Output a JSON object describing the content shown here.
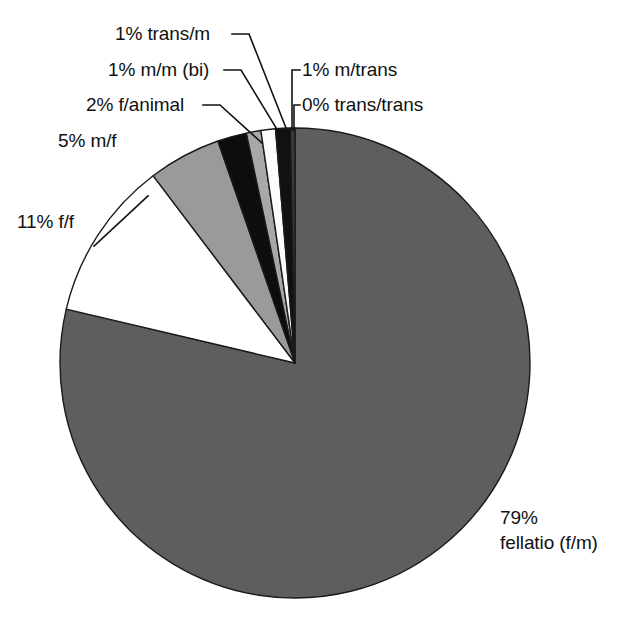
{
  "chart_data": {
    "type": "pie",
    "title": "",
    "subtitle": "",
    "xlabel": "",
    "ylabel": "",
    "legend_position": "none",
    "grid": false,
    "start_angle_deg": 0,
    "direction": "clockwise",
    "total_percent": 100,
    "categories": [
      "fellatio (f/m)",
      "f/f",
      "m/f",
      "f/animal",
      "m/m (bi)",
      "trans/m",
      "m/trans",
      "trans/trans"
    ],
    "values": [
      79,
      11,
      5,
      2,
      1,
      1,
      1,
      0
    ],
    "slices": [
      {
        "label": "fellatio (f/m)",
        "percent": 79,
        "display_label": "79%\nfellatio (f/m)",
        "percent_text": "79%",
        "name_text": "fellatio (f/m)",
        "color": "#5e5e5e",
        "stroke": "#1a1a1a"
      },
      {
        "label": "f/f",
        "percent": 11,
        "display_label": "11% f/f",
        "color": "#ffffff",
        "stroke": "#1a1a1a"
      },
      {
        "label": "m/f",
        "percent": 5,
        "display_label": "5% m/f",
        "color": "#9a9a9a",
        "stroke": "#1a1a1a"
      },
      {
        "label": "f/animal",
        "percent": 2,
        "display_label": "2% f/animal",
        "color": "#0d0d0d",
        "stroke": "#1a1a1a"
      },
      {
        "label": "m/m (bi)",
        "percent": 1,
        "display_label": "1% m/m (bi)",
        "color": "#a8a8a8",
        "stroke": "#1a1a1a"
      },
      {
        "label": "trans/m",
        "percent": 1,
        "display_label": "1% trans/m",
        "color": "#fbfbfb",
        "stroke": "#1a1a1a"
      },
      {
        "label": "m/trans",
        "percent": 1,
        "display_label": "1% m/trans",
        "color": "#111111",
        "stroke": "#1a1a1a"
      },
      {
        "label": "trans/trans",
        "percent": 0,
        "display_label": "0% trans/trans",
        "color": "#3a3a3a",
        "stroke": "#1a1a1a"
      }
    ],
    "labels": {
      "trans_m": "1% trans/m",
      "mm_bi": "1% m/m (bi)",
      "f_animal": "2% f/animal",
      "m_f": "5% m/f",
      "f_f": "11% f/f",
      "m_trans": "1% m/trans",
      "trans_trans": "0% trans/trans",
      "fellatio_pct": "79%",
      "fellatio_name": "fellatio (f/m)"
    },
    "geometry": {
      "center_x": 295,
      "center_y": 363,
      "radius": 235
    }
  }
}
